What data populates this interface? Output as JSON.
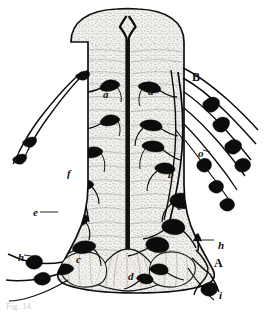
{
  "figure": {
    "caption": "Fig. 14.",
    "background_color": "#ffffff",
    "ink_color": "#111111",
    "tissue_fill": "#f2f0ec",
    "stipple_color": "#3b3b3b"
  },
  "labels": [
    {
      "id": "label-a-left",
      "text": "a",
      "case": "lower",
      "x": 103,
      "y": 89,
      "note": "left dorsal horn neuron"
    },
    {
      "id": "label-a-right",
      "text": "a",
      "case": "lower",
      "x": 148,
      "y": 86,
      "note": "right dorsal horn neuron"
    },
    {
      "id": "label-B",
      "text": "B",
      "case": "upper",
      "x": 192,
      "y": 71,
      "note": "dorsal root entry zone"
    },
    {
      "id": "label-o",
      "text": "o",
      "case": "lower",
      "x": 198,
      "y": 148,
      "note": "dorsal root fibre bundle"
    },
    {
      "id": "label-b",
      "text": "b",
      "case": "lower",
      "x": 168,
      "y": 169,
      "note": "intermediate neuron"
    },
    {
      "id": "label-f",
      "text": "f",
      "case": "lower",
      "x": 67,
      "y": 168,
      "note": "left intermediate fibre"
    },
    {
      "id": "label-e-left",
      "text": "e",
      "case": "lower",
      "x": 33,
      "y": 207,
      "note": "left ventral horn cell group"
    },
    {
      "id": "label-e-right",
      "text": "e",
      "case": "lower",
      "x": 177,
      "y": 201,
      "note": "right ventral horn cell group"
    },
    {
      "id": "label-c-left",
      "text": "c",
      "case": "lower",
      "x": 76,
      "y": 254,
      "note": "left ventral commissural cell"
    },
    {
      "id": "label-c-right",
      "text": "c",
      "case": "lower",
      "x": 148,
      "y": 241,
      "note": "right ventral commissural cell"
    },
    {
      "id": "label-h-left",
      "text": "h",
      "case": "lower",
      "x": 18,
      "y": 252,
      "note": "left ventral root"
    },
    {
      "id": "label-h-right",
      "text": "h",
      "case": "lower",
      "x": 218,
      "y": 240,
      "note": "right ventral root"
    },
    {
      "id": "label-d",
      "text": "d",
      "case": "lower",
      "x": 128,
      "y": 271,
      "note": "ventral median fissure region"
    },
    {
      "id": "label-A",
      "text": "A",
      "case": "upper",
      "x": 214,
      "y": 257,
      "note": "ventral root exit zone"
    },
    {
      "id": "label-i",
      "text": "i",
      "case": "lower",
      "x": 219,
      "y": 290,
      "note": "peripheral motor fibre"
    }
  ],
  "legend": {
    "A": "ventral root exit zone",
    "B": "dorsal root entry zone",
    "a": "dorsal horn neuron",
    "b": "intermediate neuron",
    "c": "commissural cell",
    "d": "ventral median region",
    "e": "ventral horn cell group",
    "f": "intermediate fibre",
    "h": "root filament",
    "i": "peripheral motor fibre",
    "o": "dorsal root fibre bundle"
  }
}
